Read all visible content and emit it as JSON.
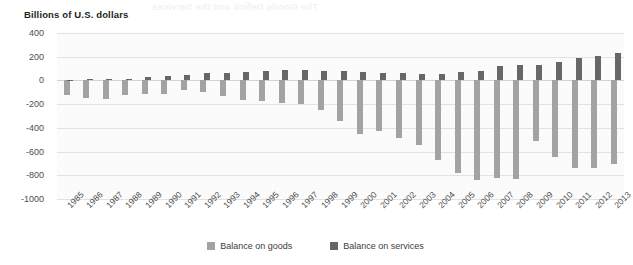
{
  "axis_title": "Billions of U.S. dollars",
  "bleed_text": "The Goods Deficit and the Services",
  "legend": {
    "position": "bottom-center",
    "items": [
      {
        "label": "Balance on goods",
        "color": "#a3a3a3",
        "key": "goods"
      },
      {
        "label": "Balance on services",
        "color": "#676767",
        "key": "services"
      }
    ]
  },
  "chart_data": {
    "type": "bar",
    "title": "Billions of U.S. dollars",
    "xlabel": "",
    "ylabel": "Billions of U.S. dollars",
    "ylim": [
      -1000,
      400
    ],
    "yticks": [
      400,
      200,
      0,
      -200,
      -400,
      -600,
      -800,
      -1000
    ],
    "ytick_labels": [
      "400",
      "200",
      "0",
      "-200",
      "-400",
      "-600",
      "-800",
      "-1000"
    ],
    "grid": true,
    "categories": [
      "1985",
      "1986",
      "1987",
      "1988",
      "1989",
      "1990",
      "1991",
      "1992",
      "1993",
      "1994",
      "1995",
      "1996",
      "1997",
      "1998",
      "1999",
      "2000",
      "2001",
      "2002",
      "2003",
      "2004",
      "2005",
      "2006",
      "2007",
      "2008",
      "2009",
      "2010",
      "2011",
      "2012",
      "2013"
    ],
    "series": [
      {
        "name": "Balance on goods",
        "color": "#a3a3a3",
        "values": [
          -122,
          -145,
          -160,
          -127,
          -116,
          -111,
          -77,
          -97,
          -133,
          -166,
          -174,
          -191,
          -198,
          -248,
          -346,
          -452,
          -427,
          -482,
          -548,
          -669,
          -783,
          -837,
          -821,
          -833,
          -510,
          -649,
          -741,
          -741,
          -702
        ]
      },
      {
        "name": "Balance on services",
        "color": "#676767",
        "values": [
          1,
          12,
          8,
          13,
          31,
          38,
          50,
          59,
          63,
          68,
          76,
          86,
          89,
          81,
          81,
          70,
          63,
          59,
          52,
          55,
          67,
          83,
          121,
          133,
          130,
          154,
          187,
          205,
          231
        ]
      }
    ]
  }
}
